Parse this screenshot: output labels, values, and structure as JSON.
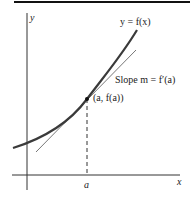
{
  "figure": {
    "curve_label": "y = f(x)",
    "tangent_label": "Slope m = f′(a)",
    "point_label": "(a, f(a))",
    "x_axis_label": "x",
    "y_axis_label": "y",
    "x_tick_label": "a",
    "colors": {
      "curve": "#3a3a3a",
      "tangent": "#777777",
      "axes": "#333333",
      "rule": "#111111"
    }
  }
}
